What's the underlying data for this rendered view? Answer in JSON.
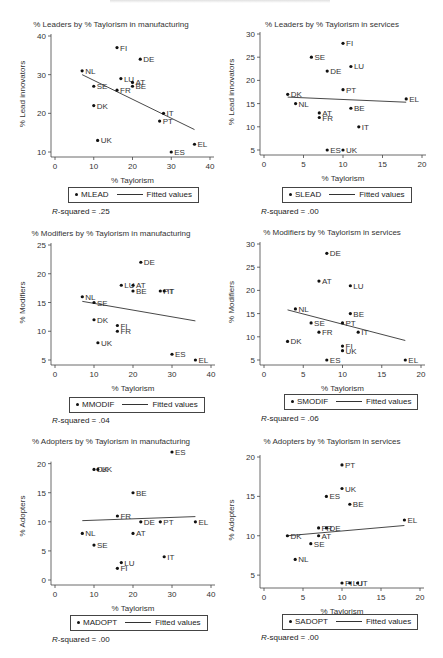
{
  "chart_data": [
    {
      "type": "scatter",
      "id": "mlead",
      "title": "% Leaders by % Taylorism in manufacturing",
      "xlabel": "% Taylorism",
      "ylabel": "% Lead innovators",
      "xlim": [
        0,
        40
      ],
      "ylim": [
        10,
        40
      ],
      "xticks": [
        0,
        10,
        20,
        30,
        40
      ],
      "yticks": [
        10,
        20,
        30,
        40
      ],
      "legend": [
        "MLEAD",
        "Fitted values"
      ],
      "r_squared": ".25",
      "fit": {
        "x1": 7,
        "y1": 30,
        "x2": 36,
        "y2": 15.8
      },
      "points": [
        {
          "label": "FI",
          "x": 16,
          "y": 37
        },
        {
          "label": "DE",
          "x": 22,
          "y": 34
        },
        {
          "label": "NL",
          "x": 7,
          "y": 31
        },
        {
          "label": "LU",
          "x": 17,
          "y": 29
        },
        {
          "label": "AT",
          "x": 20,
          "y": 28
        },
        {
          "label": "BE",
          "x": 20,
          "y": 27
        },
        {
          "label": "SE",
          "x": 10,
          "y": 27
        },
        {
          "label": "FR",
          "x": 16,
          "y": 26
        },
        {
          "label": "DK",
          "x": 10,
          "y": 22
        },
        {
          "label": "IT",
          "x": 28,
          "y": 20
        },
        {
          "label": "PT",
          "x": 27,
          "y": 18
        },
        {
          "label": "UK",
          "x": 11,
          "y": 13
        },
        {
          "label": "EL",
          "x": 36,
          "y": 12
        },
        {
          "label": "ES",
          "x": 30,
          "y": 10
        }
      ]
    },
    {
      "type": "scatter",
      "id": "slead",
      "title": "% Leaders by % Taylorism in services",
      "xlabel": "% Taylorism",
      "ylabel": "% Lead innovators",
      "xlim": [
        0,
        20
      ],
      "ylim": [
        5,
        30
      ],
      "xticks": [
        0,
        5,
        10,
        15,
        20
      ],
      "yticks": [
        5,
        10,
        15,
        20,
        25,
        30
      ],
      "legend": [
        "SLEAD",
        "Fitted values"
      ],
      "r_squared": ".00",
      "fit": {
        "x1": 3,
        "y1": 16.4,
        "x2": 18,
        "y2": 15.3
      },
      "points": [
        {
          "label": "FI",
          "x": 10,
          "y": 28
        },
        {
          "label": "SE",
          "x": 6,
          "y": 25
        },
        {
          "label": "LU",
          "x": 11,
          "y": 23
        },
        {
          "label": "DE",
          "x": 8,
          "y": 22
        },
        {
          "label": "PT",
          "x": 10,
          "y": 18
        },
        {
          "label": "DK",
          "x": 3,
          "y": 17
        },
        {
          "label": "EL",
          "x": 18,
          "y": 16
        },
        {
          "label": "NL",
          "x": 4,
          "y": 15
        },
        {
          "label": "BE",
          "x": 11,
          "y": 14
        },
        {
          "label": "AT",
          "x": 7,
          "y": 13
        },
        {
          "label": "FR",
          "x": 7,
          "y": 12
        },
        {
          "label": "IT",
          "x": 12,
          "y": 10
        },
        {
          "label": "ES",
          "x": 8,
          "y": 5
        },
        {
          "label": "UK",
          "x": 10,
          "y": 5
        }
      ]
    },
    {
      "type": "scatter",
      "id": "mmodif",
      "title": "% Modifiers by % Taylorism in manufacturing",
      "xlabel": "% Taylorism",
      "ylabel": "% Modifiers",
      "xlim": [
        0,
        40
      ],
      "ylim": [
        5,
        25
      ],
      "xticks": [
        0,
        10,
        20,
        30,
        40
      ],
      "yticks": [
        5,
        10,
        15,
        20,
        25
      ],
      "legend": [
        "MMODIF",
        "Fitted values"
      ],
      "r_squared": ".04",
      "fit": {
        "x1": 7,
        "y1": 15.2,
        "x2": 36,
        "y2": 11.8
      },
      "points": [
        {
          "label": "DE",
          "x": 22,
          "y": 22
        },
        {
          "label": "LU",
          "x": 17,
          "y": 18
        },
        {
          "label": "AT",
          "x": 20,
          "y": 18
        },
        {
          "label": "BE",
          "x": 20,
          "y": 17
        },
        {
          "label": "PT",
          "x": 27,
          "y": 17
        },
        {
          "label": "IT",
          "x": 28,
          "y": 17
        },
        {
          "label": "NL",
          "x": 7,
          "y": 16
        },
        {
          "label": "SE",
          "x": 10,
          "y": 15
        },
        {
          "label": "DK",
          "x": 10,
          "y": 12
        },
        {
          "label": "FI",
          "x": 16,
          "y": 11
        },
        {
          "label": "FR",
          "x": 16,
          "y": 10
        },
        {
          "label": "UK",
          "x": 11,
          "y": 8
        },
        {
          "label": "ES",
          "x": 30,
          "y": 6
        },
        {
          "label": "EL",
          "x": 36,
          "y": 5
        }
      ]
    },
    {
      "type": "scatter",
      "id": "smodif",
      "title": "% Modifiers by % Taylorism in services",
      "xlabel": "% Taylorism",
      "ylabel": "% Modifiers",
      "xlim": [
        0,
        20
      ],
      "ylim": [
        5,
        30
      ],
      "xticks": [
        0,
        5,
        10,
        15,
        20
      ],
      "yticks": [
        5,
        10,
        15,
        20,
        25,
        30
      ],
      "legend": [
        "SMODIF",
        "Fitted values"
      ],
      "r_squared": ".06",
      "fit": {
        "x1": 3,
        "y1": 15.8,
        "x2": 18,
        "y2": 9.2
      },
      "points": [
        {
          "label": "DE",
          "x": 8,
          "y": 28
        },
        {
          "label": "AT",
          "x": 7,
          "y": 22
        },
        {
          "label": "LU",
          "x": 11,
          "y": 21
        },
        {
          "label": "NL",
          "x": 4,
          "y": 16
        },
        {
          "label": "BE",
          "x": 11,
          "y": 15
        },
        {
          "label": "SE",
          "x": 6,
          "y": 13
        },
        {
          "label": "PT",
          "x": 10,
          "y": 13
        },
        {
          "label": "FR",
          "x": 7,
          "y": 11
        },
        {
          "label": "IT",
          "x": 12,
          "y": 11
        },
        {
          "label": "DK",
          "x": 3,
          "y": 9
        },
        {
          "label": "FI",
          "x": 10,
          "y": 8
        },
        {
          "label": "UK",
          "x": 10,
          "y": 7
        },
        {
          "label": "ES",
          "x": 8,
          "y": 5
        },
        {
          "label": "EL",
          "x": 18,
          "y": 5
        }
      ]
    },
    {
      "type": "scatter",
      "id": "madopt",
      "title": "% Adopters by % Taylorism in manufacturing",
      "xlabel": "% Taylorism",
      "ylabel": "% Adopters",
      "xlim": [
        0,
        40
      ],
      "ylim": [
        0,
        22
      ],
      "xticks": [
        0,
        10,
        20,
        30,
        40
      ],
      "yticks": [
        0,
        5,
        10,
        15,
        20
      ],
      "legend": [
        "MADOPT",
        "Fitted values"
      ],
      "r_squared": ".00",
      "fit": {
        "x1": 7,
        "y1": 10.2,
        "x2": 36,
        "y2": 10.9
      },
      "points": [
        {
          "label": "ES",
          "x": 30,
          "y": 22
        },
        {
          "label": "DK",
          "x": 10,
          "y": 19
        },
        {
          "label": "UK",
          "x": 11,
          "y": 19
        },
        {
          "label": "BE",
          "x": 20,
          "y": 15
        },
        {
          "label": "FR",
          "x": 16,
          "y": 11
        },
        {
          "label": "DE",
          "x": 22,
          "y": 10
        },
        {
          "label": "PT",
          "x": 27,
          "y": 10
        },
        {
          "label": "EL",
          "x": 36,
          "y": 10
        },
        {
          "label": "NL",
          "x": 7,
          "y": 8
        },
        {
          "label": "AT",
          "x": 20,
          "y": 8
        },
        {
          "label": "SE",
          "x": 10,
          "y": 6
        },
        {
          "label": "IT",
          "x": 28,
          "y": 4
        },
        {
          "label": "LU",
          "x": 17,
          "y": 3
        },
        {
          "label": "FI",
          "x": 16,
          "y": 2
        }
      ]
    },
    {
      "type": "scatter",
      "id": "sadopt",
      "title": "% Adopters by % Taylorism in services",
      "xlabel": "% Taylorism",
      "ylabel": "% Adopters",
      "xlim": [
        0,
        20
      ],
      "ylim": [
        4,
        20
      ],
      "xticks": [
        0,
        5,
        10,
        15,
        20
      ],
      "yticks": [
        5,
        10,
        15,
        20
      ],
      "legend": [
        "SADOPT",
        "Fitted values"
      ],
      "r_squared": ".00",
      "fit": {
        "x1": 3,
        "y1": 10,
        "x2": 18,
        "y2": 11.3
      },
      "points": [
        {
          "label": "PT",
          "x": 10,
          "y": 19
        },
        {
          "label": "UK",
          "x": 10,
          "y": 16
        },
        {
          "label": "ES",
          "x": 8,
          "y": 15
        },
        {
          "label": "BE",
          "x": 11,
          "y": 14
        },
        {
          "label": "EL",
          "x": 18,
          "y": 12
        },
        {
          "label": "FR",
          "x": 7,
          "y": 11
        },
        {
          "label": "DE",
          "x": 8,
          "y": 11
        },
        {
          "label": "DK",
          "x": 3,
          "y": 10
        },
        {
          "label": "AT",
          "x": 7,
          "y": 10
        },
        {
          "label": "SE",
          "x": 6,
          "y": 9
        },
        {
          "label": "NL",
          "x": 4,
          "y": 7
        },
        {
          "label": "FI",
          "x": 10,
          "y": 4
        },
        {
          "label": "LU",
          "x": 11,
          "y": 4
        },
        {
          "label": "IT",
          "x": 12,
          "y": 4
        }
      ]
    }
  ],
  "common": {
    "fitted_label": "Fitted values",
    "r_squared_prefix_italic": "R",
    "r_squared_prefix_rest": "-squared = "
  }
}
